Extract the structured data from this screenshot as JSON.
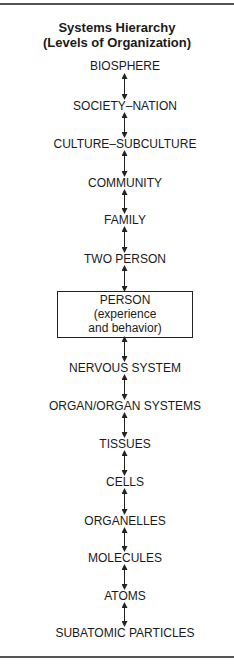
{
  "diagram": {
    "title_line1": "Systems Hierarchy",
    "title_line2": "(Levels of Organization)",
    "levels": [
      {
        "label": "BIOSPHERE"
      },
      {
        "label": "SOCIETY–NATION"
      },
      {
        "label": "CULTURE–SUBCULTURE"
      },
      {
        "label": "COMMUNITY"
      },
      {
        "label": "FAMILY"
      },
      {
        "label": "TWO PERSON"
      },
      {
        "label": "PERSON",
        "line2": "(experience",
        "line3": "and behavior)",
        "boxed": true
      },
      {
        "label": "NERVOUS SYSTEM"
      },
      {
        "label": "ORGAN/ORGAN SYSTEMS"
      },
      {
        "label": "TISSUES"
      },
      {
        "label": "CELLS"
      },
      {
        "label": "ORGANELLES"
      },
      {
        "label": "MOLECULES"
      },
      {
        "label": "ATOMS"
      },
      {
        "label": "SUBATOMIC PARTICLES"
      }
    ],
    "connector": "double-headed-arrow"
  }
}
